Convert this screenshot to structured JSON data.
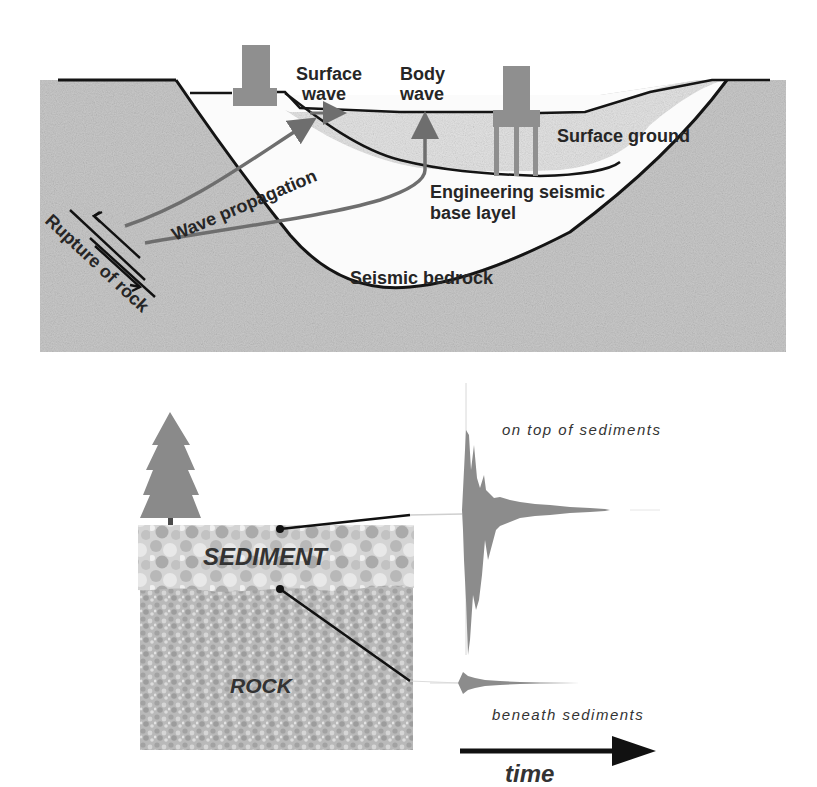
{
  "top_panel": {
    "labels": {
      "surface_wave_1": "Surface",
      "surface_wave_2": "wave",
      "body_wave_1": "Body",
      "body_wave_2": "wave",
      "surface_ground": "Surface ground",
      "engineering_1": "Engineering seismic",
      "engineering_2": "base layel",
      "seismic_bedrock": "Seismic bedrock",
      "wave_propagation": "Wave propagation",
      "rupture_of_rock": "Rupture of rock"
    },
    "colors": {
      "rock": "#c9c9c9",
      "surface_ground": "#e4e4e4",
      "engineering_layer": "#fbfbfb",
      "line": "#141414",
      "arrow": "#6e6e6e",
      "building": "#8f8f8f"
    }
  },
  "bottom_panel": {
    "labels": {
      "sediment": "SEDIMENT",
      "rock": "ROCK",
      "on_top": "on top of sediments",
      "beneath": "beneath sediments",
      "time": "time"
    },
    "colors": {
      "tree": "#8a8a8a",
      "sediment": "#c8c8c8",
      "rock": "#b5b5b5",
      "waveform": "#8c8c8c",
      "arrow": "#111111"
    }
  }
}
